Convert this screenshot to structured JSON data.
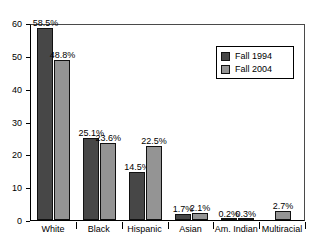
{
  "chart_data": {
    "type": "bar",
    "title": "Fall 1994 vs Fall 2004",
    "xlabel": "",
    "ylabel": "",
    "ylim": [
      0,
      60
    ],
    "yticks": [
      0,
      10,
      20,
      30,
      40,
      50,
      60
    ],
    "grid": false,
    "legend_position": "top-right",
    "categories": [
      "White",
      "Black",
      "Hispanic",
      "Asian",
      "Am. Indian",
      "Multiracial"
    ],
    "series": [
      {
        "name": "Fall 1994",
        "color": "#474747",
        "values": [
          58.5,
          25.1,
          14.5,
          1.7,
          0.2,
          null
        ],
        "labels": [
          "58.5%",
          "25.1%",
          "14.5%",
          "1.7%",
          "0.2%",
          ""
        ]
      },
      {
        "name": "Fall 2004",
        "color": "#949494",
        "values": [
          48.8,
          23.6,
          22.5,
          2.1,
          0.3,
          2.7
        ],
        "labels": [
          "48.8%",
          "23.6%",
          "22.5%",
          "2.1%",
          "0.3%",
          "2.7%"
        ]
      }
    ]
  },
  "legend": {
    "entries": [
      {
        "label": "Fall 1994",
        "swatch": "dark-gray-swatch"
      },
      {
        "label": "Fall 2004",
        "swatch": "light-gray-swatch"
      }
    ]
  },
  "axes": {
    "y_tick_labels": [
      "60",
      "50",
      "40",
      "30",
      "20",
      "10",
      "0"
    ],
    "x_tick_labels": [
      "White",
      "Black",
      "Hispanic",
      "Asian",
      "Am. Indian",
      "Multiracial"
    ]
  }
}
